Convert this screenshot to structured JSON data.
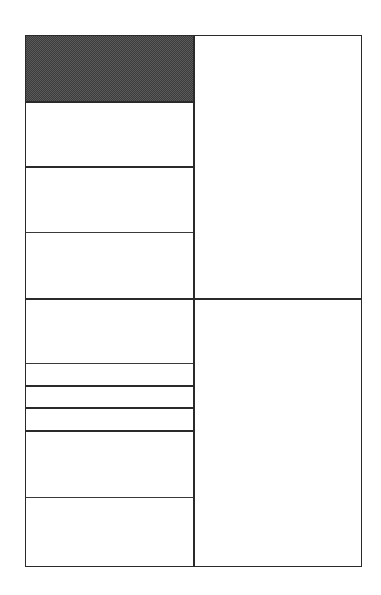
{
  "diagram": {
    "type": "grid-layout",
    "frame": {
      "left": 25,
      "top": 35,
      "right": 362,
      "bottom": 567
    },
    "column_divider_x": 194,
    "colors": {
      "line": "#2a2a2a",
      "shaded_fill": "#5a5a5a",
      "background": "#ffffff"
    },
    "left_column": {
      "row_boundaries_y": [
        35,
        102,
        167,
        233,
        299,
        364,
        386,
        408,
        431,
        498,
        567
      ],
      "cells": [
        {
          "index": 0,
          "top": 35,
          "bottom": 102,
          "shaded": true
        },
        {
          "index": 1,
          "top": 102,
          "bottom": 167,
          "shaded": false
        },
        {
          "index": 2,
          "top": 167,
          "bottom": 233,
          "shaded": false
        },
        {
          "index": 3,
          "top": 233,
          "bottom": 299,
          "shaded": false
        },
        {
          "index": 4,
          "top": 299,
          "bottom": 364,
          "shaded": false
        },
        {
          "index": 5,
          "top": 364,
          "bottom": 386,
          "shaded": false
        },
        {
          "index": 6,
          "top": 386,
          "bottom": 408,
          "shaded": false
        },
        {
          "index": 7,
          "top": 408,
          "bottom": 431,
          "shaded": false
        },
        {
          "index": 8,
          "top": 431,
          "bottom": 498,
          "shaded": false
        },
        {
          "index": 9,
          "top": 498,
          "bottom": 567,
          "shaded": false
        }
      ]
    },
    "right_column": {
      "row_boundaries_y": [
        35,
        299,
        567
      ],
      "cells": [
        {
          "index": 0,
          "top": 35,
          "bottom": 299,
          "shaded": false
        },
        {
          "index": 1,
          "top": 299,
          "bottom": 567,
          "shaded": false
        }
      ]
    }
  }
}
